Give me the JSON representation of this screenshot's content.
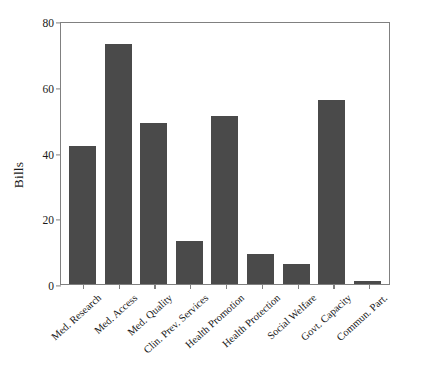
{
  "chart_data": {
    "type": "bar",
    "title": "",
    "xlabel": "",
    "ylabel": "Bills",
    "ylim": [
      0,
      80
    ],
    "yticks": [
      0,
      20,
      40,
      60,
      80
    ],
    "grid": false,
    "legend": null,
    "bar_color": "#4a4a4a",
    "axis_color": "#808080",
    "categories": [
      "Med. Research",
      "Med. Access",
      "Med. Quality",
      "Clin. Prev. Services",
      "Health Promotion",
      "Health Protection",
      "Social Welfare",
      "Govt. Capacity",
      "Commun. Part."
    ],
    "values": [
      42,
      73,
      49,
      13,
      51,
      9,
      6,
      56,
      1
    ]
  }
}
